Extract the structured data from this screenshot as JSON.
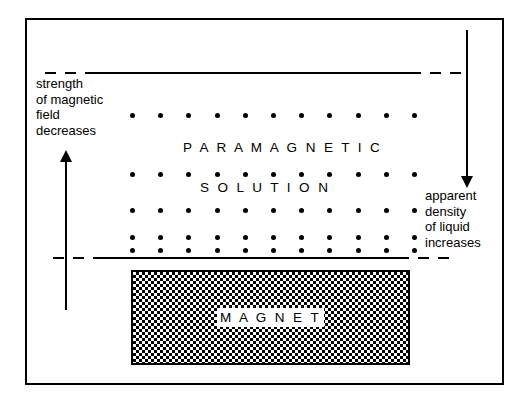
{
  "figure": {
    "background_color": "#ffffff",
    "line_color": "#000000"
  },
  "labels": {
    "paramagnetic": "P A R A M A G N E T I C",
    "solution": "S O L U T I O N",
    "magnet": "M A G N E T"
  },
  "annotations": {
    "left_caption": "strength\nof magnetic\nfield\ndecreases",
    "right_caption": "apparent\ndensity\nof liquid\nincreases"
  },
  "arrows": [
    {
      "name": "strength-arrow",
      "direction": "up",
      "meaning": "strength of magnetic field decreases upward"
    },
    {
      "name": "density-arrow",
      "direction": "down",
      "meaning": "apparent density of liquid increases downward"
    }
  ],
  "chart_data": {
    "type": "scatter",
    "xlabel": "",
    "ylabel": "",
    "xlim": [
      0,
      530
    ],
    "ylim": [
      0,
      408
    ],
    "grid": false,
    "legend": "none",
    "dot_rows": [
      {
        "row": 1,
        "y": 113,
        "x_start": 130,
        "x_step": 28.2,
        "count": 11
      },
      {
        "row": 2,
        "y": 172,
        "x_start": 130,
        "x_step": 28.2,
        "count": 11
      },
      {
        "row": 3,
        "y": 208,
        "x_start": 130,
        "x_step": 28.2,
        "count": 11
      },
      {
        "row": 4,
        "y": 235,
        "x_start": 130,
        "x_step": 28.2,
        "count": 11
      },
      {
        "row": 5,
        "y": 248,
        "x_start": 130,
        "x_step": 28.2,
        "count": 11
      }
    ],
    "boundaries": [
      {
        "name": "top-liquid-surface",
        "y": 71,
        "style": "dash-solid-dash"
      },
      {
        "name": "bottom-liquid-surface",
        "y": 256,
        "style": "dash-solid-dash"
      }
    ],
    "magnet_block": {
      "x": 131,
      "y": 270,
      "width": 279,
      "height": 95,
      "fill": "checkerboard"
    }
  }
}
